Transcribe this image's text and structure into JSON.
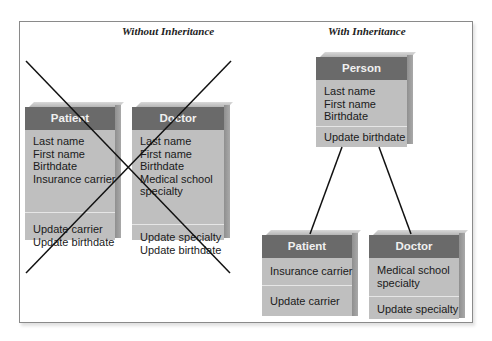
{
  "without": {
    "title": "Without Inheritance",
    "patient": {
      "name": "Patient",
      "attributes": [
        "Last name",
        "First name",
        "Birthdate",
        "Insurance carrier"
      ],
      "methods": [
        "Update carrier",
        "Update birthdate"
      ]
    },
    "doctor": {
      "name": "Doctor",
      "attributes": [
        "Last name",
        "First name",
        "Birthdate",
        "Medical school",
        "specialty"
      ],
      "methods": [
        "Update specialty",
        "Update birthdate"
      ]
    }
  },
  "with": {
    "title": "With Inheritance",
    "person": {
      "name": "Person",
      "attributes": [
        "Last name",
        "First name",
        "Birthdate"
      ],
      "methods": [
        "Update birthdate"
      ]
    },
    "patient": {
      "name": "Patient",
      "attributes": [
        "Insurance carrier"
      ],
      "methods": [
        "Update carrier"
      ]
    },
    "doctor": {
      "name": "Doctor",
      "attributes": [
        "Medical school",
        "specialty"
      ],
      "methods": [
        "Update specialty"
      ]
    }
  },
  "colors": {
    "header": "#6a6a6a",
    "body": "#bfbfbf",
    "frame": "#8a8a8a",
    "lines": "#111111"
  }
}
